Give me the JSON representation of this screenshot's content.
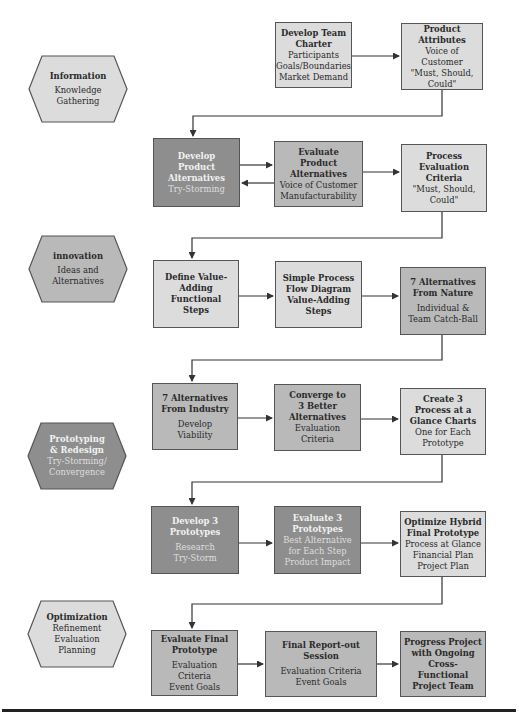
{
  "diagram": {
    "phases": [
      {
        "id": "information",
        "title": "Information",
        "lines": [
          "Knowledge",
          "Gathering"
        ],
        "fill": "#dcdcdc",
        "text_color": "#2a2a2a"
      },
      {
        "id": "innovation",
        "title": "innovation",
        "lines": [
          "Ideas and",
          "Alternatives"
        ],
        "fill": "#b9b9b9",
        "text_color": "#2a2a2a"
      },
      {
        "id": "prototyping",
        "title": "Prototyping",
        "title2": "& Redesign",
        "lines": [
          "Try-Storming/",
          "Convergence"
        ],
        "fill": "#8e8e8e",
        "text_color": "#f2f2f2"
      },
      {
        "id": "optimization",
        "title": "Optimization",
        "lines": [
          "Refinement",
          "Evaluation",
          "Planning"
        ],
        "fill": "#dcdcdc",
        "text_color": "#2a2a2a"
      }
    ],
    "steps": [
      {
        "id": "develop-team-charter",
        "title": [
          "Develop Team",
          "Charter"
        ],
        "lines": [
          "Participants",
          "Goals/Boundaries",
          "Market Demand"
        ],
        "shade": "light"
      },
      {
        "id": "product-attributes",
        "title": [
          "Product",
          "Attributes"
        ],
        "lines": [
          "Voice of Customer",
          "\"Must, Should,",
          "Could\""
        ],
        "shade": "light"
      },
      {
        "id": "develop-product-alternatives",
        "title": [
          "Develop",
          "Product",
          "Alternatives"
        ],
        "lines": [
          "Try-Storming"
        ],
        "shade": "dark"
      },
      {
        "id": "evaluate-product-alternatives",
        "title": [
          "Evaluate",
          "Product",
          "Alternatives"
        ],
        "lines": [
          "Voice of Customer",
          "Manufacturability"
        ],
        "shade": "mid"
      },
      {
        "id": "process-evaluation-criteria",
        "title": [
          "Process",
          "Evaluation",
          "Criteria"
        ],
        "lines": [
          "\"Must, Should,",
          "Could\""
        ],
        "shade": "light"
      },
      {
        "id": "define-value-adding-steps",
        "title": [
          "Define Value-",
          "Adding",
          "Functional",
          "Steps"
        ],
        "lines": [],
        "shade": "light"
      },
      {
        "id": "simple-process-flow-diagram",
        "title": [
          "Simple Process",
          "Flow Diagram",
          "Value-Adding",
          "Steps"
        ],
        "lines": [],
        "shade": "light"
      },
      {
        "id": "alternatives-from-nature",
        "title": [
          "7 Alternatives",
          "From Nature"
        ],
        "lines": [
          "Individual &",
          "Team Catch-Ball"
        ],
        "shade": "mid"
      },
      {
        "id": "alternatives-from-industry",
        "title": [
          "7 Alternatives",
          "From Industry"
        ],
        "lines": [
          "Develop",
          "Viability"
        ],
        "shade": "mid"
      },
      {
        "id": "converge-to-3",
        "title": [
          "Converge to",
          "3 Better",
          "Alternatives"
        ],
        "lines": [
          "Evaluation",
          "Criteria"
        ],
        "shade": "mid"
      },
      {
        "id": "create-3-process-charts",
        "title": [
          "Create 3",
          "Process at a",
          "Glance Charts"
        ],
        "lines": [
          "One for Each",
          "Prototype"
        ],
        "shade": "light"
      },
      {
        "id": "develop-3-prototypes",
        "title": [
          "Develop 3",
          "Prototypes"
        ],
        "lines": [
          "Research",
          "Try-Storm"
        ],
        "shade": "dark"
      },
      {
        "id": "evaluate-3-prototypes",
        "title": [
          "Evaluate 3",
          "Prototypes"
        ],
        "lines": [
          "Best Alternative",
          "for Each Step",
          "Product Impact"
        ],
        "shade": "dark"
      },
      {
        "id": "optimize-hybrid-prototype",
        "title": [
          "Optimize Hybrid",
          "Final Prototype"
        ],
        "lines": [
          "Process at Glance",
          "Financial Plan",
          "Project Plan"
        ],
        "shade": "light"
      },
      {
        "id": "evaluate-final-prototype",
        "title": [
          "Evaluate Final",
          "Prototype"
        ],
        "lines": [
          "Evaluation Criteria",
          "Event Goals"
        ],
        "shade": "mid"
      },
      {
        "id": "final-report-out-session",
        "title": [
          "Final Report-out",
          "Session"
        ],
        "lines": [
          "Evaluation Criteria",
          "Event Goals"
        ],
        "shade": "mid"
      },
      {
        "id": "progress-project",
        "title": [
          "Progress Project",
          "with Ongoing",
          "Cross-Functional",
          "Project Team"
        ],
        "lines": [],
        "shade": "mid"
      }
    ],
    "colors": {
      "light": "#dcdcdc",
      "mid": "#b9b9b9",
      "dark": "#8e8e8e",
      "line": "#333333",
      "border": "#555555"
    }
  }
}
